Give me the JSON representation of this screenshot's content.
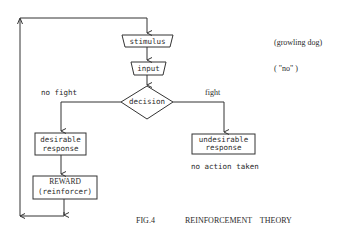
{
  "diagram": {
    "type": "flowchart",
    "title": "REINFORCEMENT THEORY",
    "figure_label": "FIG.4",
    "colors": {
      "line": "#333333",
      "background": "#ffffff",
      "text": "#2a2a2a"
    },
    "nodes": {
      "stimulus": {
        "label": "stimulus",
        "shape": "trapezoid"
      },
      "input": {
        "label": "input",
        "shape": "trapezoid"
      },
      "decision": {
        "label": "decision",
        "shape": "diamond"
      },
      "desirable": {
        "line1": "desirable",
        "line2": "response",
        "shape": "rectangle"
      },
      "reward": {
        "line1": "REWARD",
        "line2": "(reinforcer)",
        "shape": "rectangle"
      },
      "undesirable": {
        "line1": "undesirable",
        "line2": "response",
        "shape": "rectangle"
      }
    },
    "edges": [
      {
        "from": "stimulus",
        "to": "input"
      },
      {
        "from": "input",
        "to": "decision"
      },
      {
        "from": "decision",
        "to": "desirable",
        "label": "no fight"
      },
      {
        "from": "decision",
        "to": "undesirable",
        "label": "fight"
      },
      {
        "from": "desirable",
        "to": "reward"
      },
      {
        "from": "reward",
        "to": "stimulus",
        "label": "feedback loop"
      }
    ],
    "annotations": {
      "stimulus_example": "(growling dog)",
      "input_example": "( \"no\" )",
      "no_fight": "no fight",
      "fight": "fight",
      "no_action": "no action taken"
    }
  }
}
